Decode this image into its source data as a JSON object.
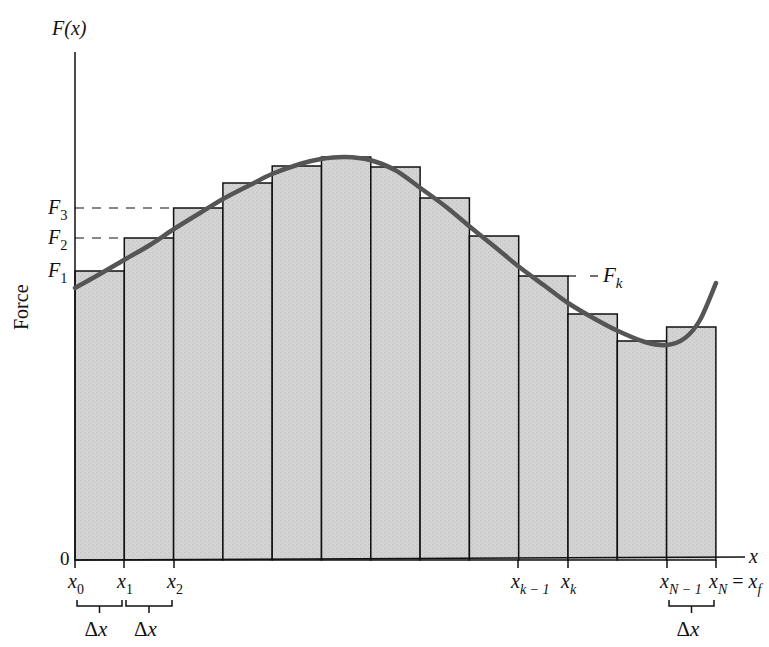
{
  "figure": {
    "y_axis_label": "F(x)",
    "y_axis_title": "Force",
    "x_axis_label": "x",
    "origin_label": "0",
    "colors": {
      "bar_fill": "#d3d3d3",
      "bar_stroke": "#111111",
      "curve": "#555555",
      "axis": "#111111",
      "background": "#ffffff"
    },
    "geometry": {
      "axis_x": 75,
      "axis_top": 52,
      "baseline_y": 560,
      "axis_right": 745,
      "bar_left": 75,
      "bar_width": 49.3
    },
    "bars": [
      {
        "index": 1,
        "top": 271
      },
      {
        "index": 2,
        "top": 238
      },
      {
        "index": 3,
        "top": 208
      },
      {
        "index": 4,
        "top": 183
      },
      {
        "index": 5,
        "top": 166
      },
      {
        "index": 6,
        "top": 157
      },
      {
        "index": 7,
        "top": 167
      },
      {
        "index": 8,
        "top": 198
      },
      {
        "index": 9,
        "top": 236
      },
      {
        "index": 10,
        "top": 276
      },
      {
        "index": 11,
        "top": 314
      },
      {
        "index": 12,
        "top": 341
      },
      {
        "index": 13,
        "top": 327
      }
    ],
    "curve_points": [
      [
        75,
        288
      ],
      [
        100,
        274
      ],
      [
        124,
        260
      ],
      [
        150,
        245
      ],
      [
        174,
        229
      ],
      [
        200,
        213
      ],
      [
        223,
        199
      ],
      [
        250,
        185
      ],
      [
        272,
        174
      ],
      [
        300,
        164
      ],
      [
        321,
        159
      ],
      [
        345,
        157
      ],
      [
        370,
        160
      ],
      [
        395,
        170
      ],
      [
        419,
        187
      ],
      [
        445,
        206
      ],
      [
        469,
        226
      ],
      [
        495,
        247
      ],
      [
        518,
        266
      ],
      [
        545,
        286
      ],
      [
        568,
        303
      ],
      [
        595,
        319
      ],
      [
        618,
        331
      ],
      [
        645,
        342
      ],
      [
        667,
        345
      ],
      [
        685,
        338
      ],
      [
        700,
        320
      ],
      [
        716,
        283
      ]
    ],
    "y_ticks": [
      {
        "name": "F1",
        "main": "F",
        "sub": "1",
        "y": 271,
        "dashed_to": 75
      },
      {
        "name": "F2",
        "main": "F",
        "sub": "2",
        "y": 238,
        "dashed_to": 124
      },
      {
        "name": "F3",
        "main": "F",
        "sub": "3",
        "y": 208,
        "dashed_to": 174
      }
    ],
    "fk_label": {
      "main": "F",
      "sub": "k",
      "y": 276,
      "from_x": 568,
      "to_x": 598
    },
    "x_ticks": [
      {
        "name": "x0",
        "main": "x",
        "sub": "0",
        "x": 75
      },
      {
        "name": "x1",
        "main": "x",
        "sub": "1",
        "x": 124
      },
      {
        "name": "x2",
        "main": "x",
        "sub": "2",
        "x": 174
      },
      {
        "name": "xk-1",
        "main": "x",
        "sub": "k − 1",
        "x": 518
      },
      {
        "name": "xk",
        "main": "x",
        "sub": "k",
        "x": 568
      },
      {
        "name": "xN-1",
        "main": "x",
        "sub": "N − 1",
        "x": 667
      },
      {
        "name": "xN",
        "main": "x",
        "sub": "N",
        "suffix": " = ",
        "suffix_main": "x",
        "suffix_sub": "f",
        "x": 716
      }
    ],
    "delta_brackets": [
      {
        "label": "Δx",
        "from": 75,
        "to": 124
      },
      {
        "label": "Δx",
        "from": 124,
        "to": 174
      },
      {
        "label": "Δx",
        "from": 667,
        "to": 716
      }
    ]
  }
}
